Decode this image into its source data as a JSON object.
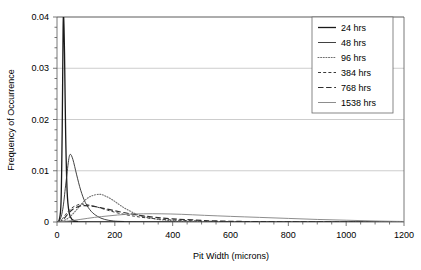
{
  "chart_data": {
    "type": "line",
    "title": "",
    "xlabel": "Pit Width (microns)",
    "ylabel": "Frequency of Occurrence",
    "xlim": [
      0,
      1200
    ],
    "ylim": [
      0,
      0.04
    ],
    "xticks": [
      0,
      200,
      400,
      600,
      800,
      1000,
      1200
    ],
    "xtick_labels": [
      "0",
      "200",
      "400",
      "600",
      "800",
      "1000",
      "1200"
    ],
    "yticks": [
      0,
      0.01,
      0.02,
      0.03,
      0.04
    ],
    "ytick_labels": [
      "0",
      "0.01",
      "0.02",
      "0.03",
      "0.04"
    ],
    "x_minor_tick_step": 50,
    "grid": "horizontal",
    "legend_position": "top-right-inside",
    "series": [
      {
        "name": "24 hrs",
        "style": "solid",
        "width": 1.3,
        "color": "#1a1a1a",
        "peak_x": 22,
        "peak_y": 0.04,
        "note": "very narrow spike clipped at axis top",
        "points": [
          [
            0,
            0
          ],
          [
            8,
            0.0005
          ],
          [
            14,
            0.004
          ],
          [
            18,
            0.018
          ],
          [
            21,
            0.037
          ],
          [
            23,
            0.04
          ],
          [
            26,
            0.033
          ],
          [
            30,
            0.017
          ],
          [
            35,
            0.006
          ],
          [
            42,
            0.0018
          ],
          [
            52,
            0.0005
          ],
          [
            70,
            0.0001
          ],
          [
            100,
            0
          ],
          [
            1200,
            0
          ]
        ]
      },
      {
        "name": "48 hrs",
        "style": "solid",
        "width": 0.9,
        "color": "#2b2b2b",
        "peak_x": 46,
        "peak_y": 0.0132,
        "points": [
          [
            0,
            0
          ],
          [
            10,
            0.0004
          ],
          [
            20,
            0.0025
          ],
          [
            30,
            0.0072
          ],
          [
            40,
            0.012
          ],
          [
            46,
            0.0132
          ],
          [
            55,
            0.0122
          ],
          [
            68,
            0.0092
          ],
          [
            82,
            0.0062
          ],
          [
            98,
            0.0038
          ],
          [
            118,
            0.0021
          ],
          [
            140,
            0.0011
          ],
          [
            165,
            0.0005
          ],
          [
            195,
            0.0002
          ],
          [
            230,
            0.0001
          ],
          [
            300,
            0
          ],
          [
            1200,
            0
          ]
        ]
      },
      {
        "name": "96 hrs",
        "style": "dotted",
        "width": 1.1,
        "color": "#6f6f6f",
        "peak_x": 148,
        "peak_y": 0.0054,
        "points": [
          [
            0,
            0
          ],
          [
            20,
            0.0002
          ],
          [
            40,
            0.0008
          ],
          [
            60,
            0.0019
          ],
          [
            80,
            0.0032
          ],
          [
            100,
            0.0044
          ],
          [
            120,
            0.0051
          ],
          [
            148,
            0.0054
          ],
          [
            170,
            0.005
          ],
          [
            195,
            0.0042
          ],
          [
            220,
            0.0032
          ],
          [
            250,
            0.0022
          ],
          [
            285,
            0.0013
          ],
          [
            320,
            0.0008
          ],
          [
            365,
            0.0004
          ],
          [
            420,
            0.0002
          ],
          [
            500,
            0.0001
          ],
          [
            620,
            0
          ],
          [
            1200,
            0
          ]
        ]
      },
      {
        "name": "384 hrs",
        "style": "dashed-short",
        "width": 1.0,
        "color": "#3a3a3a",
        "peak_x": 86,
        "peak_y": 0.0035,
        "points": [
          [
            0,
            0
          ],
          [
            15,
            0.0004
          ],
          [
            30,
            0.0015
          ],
          [
            50,
            0.0027
          ],
          [
            70,
            0.0033
          ],
          [
            86,
            0.0035
          ],
          [
            110,
            0.0033
          ],
          [
            140,
            0.0029
          ],
          [
            175,
            0.0023
          ],
          [
            215,
            0.0017
          ],
          [
            260,
            0.0012
          ],
          [
            310,
            0.0008
          ],
          [
            370,
            0.0005
          ],
          [
            440,
            0.0003
          ],
          [
            520,
            0.00015
          ],
          [
            620,
            7e-05
          ],
          [
            760,
            2e-05
          ],
          [
            1000,
            0
          ],
          [
            1200,
            0
          ]
        ]
      },
      {
        "name": "768 hrs",
        "style": "dashed-long",
        "width": 1.2,
        "color": "#2f2f2f",
        "peak_x": 95,
        "peak_y": 0.0032,
        "points": [
          [
            0,
            0
          ],
          [
            18,
            0.0003
          ],
          [
            35,
            0.0014
          ],
          [
            55,
            0.0025
          ],
          [
            78,
            0.0031
          ],
          [
            95,
            0.0032
          ],
          [
            120,
            0.0031
          ],
          [
            150,
            0.0028
          ],
          [
            190,
            0.0023
          ],
          [
            235,
            0.0018
          ],
          [
            285,
            0.0013
          ],
          [
            340,
            0.0009
          ],
          [
            400,
            0.0006
          ],
          [
            470,
            0.0004
          ],
          [
            550,
            0.0002
          ],
          [
            650,
            0.0001
          ],
          [
            800,
            3e-05
          ],
          [
            1000,
            0
          ],
          [
            1200,
            0
          ]
        ]
      },
      {
        "name": "1538 hrs",
        "style": "solid",
        "width": 0.9,
        "color": "#808080",
        "peak_x": 330,
        "peak_y": 0.0016,
        "points": [
          [
            0,
            0
          ],
          [
            40,
            0.0002
          ],
          [
            80,
            0.0005
          ],
          [
            130,
            0.0009
          ],
          [
            180,
            0.0012
          ],
          [
            240,
            0.0015
          ],
          [
            300,
            0.0016
          ],
          [
            360,
            0.0016
          ],
          [
            430,
            0.0015
          ],
          [
            510,
            0.0013
          ],
          [
            600,
            0.0011
          ],
          [
            700,
            0.0009
          ],
          [
            800,
            0.0007
          ],
          [
            900,
            0.0005
          ],
          [
            1000,
            0.00035
          ],
          [
            1100,
            0.0002
          ],
          [
            1200,
            0.0001
          ]
        ]
      }
    ]
  }
}
